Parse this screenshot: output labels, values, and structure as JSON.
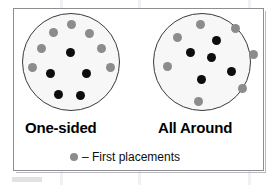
{
  "figure": {
    "title_left": "One-sided",
    "title_right": "All Around",
    "legend_text": "– First placements",
    "legend_marker": "first-placement-dot",
    "colors": {
      "first_placement": "#8c8c8c",
      "later_placement": "#0d0d0d",
      "dish_outline": "#3a3a3a",
      "dish_fill": "#f7f7f7",
      "frame_border": "#8d8d93",
      "background": "#ffffff"
    }
  },
  "chart_data": {
    "type": "scatter",
    "title": "",
    "panels": [
      {
        "name": "One-sided",
        "dish": {
          "cx": 71,
          "cy": 62,
          "r": 49
        },
        "series": [
          {
            "name": "First placements",
            "color": "#8c8c8c",
            "count": 7,
            "points": [
              {
                "x": 71,
                "y": 24,
                "r": 4.5
              },
              {
                "x": 53,
                "y": 32,
                "r": 4.5
              },
              {
                "x": 89,
                "y": 33,
                "r": 4.5
              },
              {
                "x": 41,
                "y": 48,
                "r": 4.5
              },
              {
                "x": 101,
                "y": 48,
                "r": 4.5
              },
              {
                "x": 32,
                "y": 67,
                "r": 4.5
              },
              {
                "x": 110,
                "y": 67,
                "r": 4.5
              }
            ]
          },
          {
            "name": "Later placements",
            "color": "#0d0d0d",
            "count": 5,
            "points": [
              {
                "x": 70,
                "y": 52,
                "r": 4.5
              },
              {
                "x": 50,
                "y": 73,
                "r": 4.5
              },
              {
                "x": 86,
                "y": 73,
                "r": 4.5
              },
              {
                "x": 58,
                "y": 94,
                "r": 4.5
              },
              {
                "x": 80,
                "y": 95,
                "r": 4.5
              }
            ]
          }
        ]
      },
      {
        "name": "All Around",
        "dish": {
          "cx": 202,
          "cy": 62,
          "r": 49
        },
        "series": [
          {
            "name": "First placements",
            "color": "#8c8c8c",
            "count": 7,
            "points": [
              {
                "x": 200,
                "y": 24,
                "r": 4.5
              },
              {
                "x": 235,
                "y": 28,
                "r": 4.5
              },
              {
                "x": 177,
                "y": 37,
                "r": 4.5
              },
              {
                "x": 253,
                "y": 54,
                "r": 4.5
              },
              {
                "x": 167,
                "y": 66,
                "r": 4.5
              },
              {
                "x": 242,
                "y": 88,
                "r": 4.5
              },
              {
                "x": 198,
                "y": 101,
                "r": 4.5
              }
            ]
          },
          {
            "name": "Later placements",
            "color": "#0d0d0d",
            "count": 5,
            "points": [
              {
                "x": 216,
                "y": 40,
                "r": 4.5
              },
              {
                "x": 190,
                "y": 52,
                "r": 4.5
              },
              {
                "x": 211,
                "y": 57,
                "r": 4.5
              },
              {
                "x": 231,
                "y": 71,
                "r": 4.5
              },
              {
                "x": 201,
                "y": 79,
                "r": 4.5
              }
            ]
          }
        ]
      }
    ],
    "legend": [
      {
        "label": "– First placements",
        "color": "#8c8c8c"
      }
    ],
    "xlabel": "",
    "ylabel": "",
    "grid": false,
    "legend_position": "bottom-center"
  }
}
